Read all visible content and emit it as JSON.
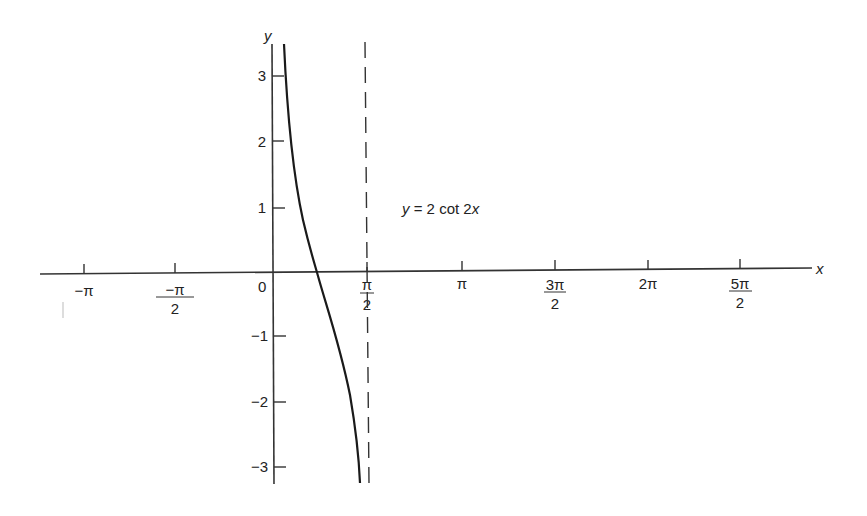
{
  "chart_data": {
    "type": "line",
    "title": "",
    "annotation": "y = 2 cot 2x",
    "xlabel": "x",
    "ylabel": "y",
    "origin_label": "0",
    "x_ticks": [
      {
        "value": -3.14159,
        "label": "−π",
        "num": "−π",
        "den": ""
      },
      {
        "value": -1.5708,
        "label": "−π/2",
        "num": "−π",
        "den": "2"
      },
      {
        "value": 1.5708,
        "label": "π/2",
        "num": "π",
        "den": "2"
      },
      {
        "value": 3.14159,
        "label": "π",
        "num": "π",
        "den": ""
      },
      {
        "value": 4.71239,
        "label": "3π/2",
        "num": "3π",
        "den": "2"
      },
      {
        "value": 6.28319,
        "label": "2π",
        "num": "2π",
        "den": ""
      },
      {
        "value": 7.85398,
        "label": "5π/2",
        "num": "5π",
        "den": "2"
      }
    ],
    "y_ticks": [
      {
        "value": 3,
        "label": "3"
      },
      {
        "value": 2,
        "label": "2"
      },
      {
        "value": 1,
        "label": "1"
      },
      {
        "value": -1,
        "label": "−1"
      },
      {
        "value": -2,
        "label": "−2"
      },
      {
        "value": -3,
        "label": "−3"
      }
    ],
    "xlim": [
      -3.6,
      8.5
    ],
    "ylim": [
      -3.3,
      3.5
    ],
    "grid": false,
    "legend": null,
    "series": [
      {
        "name": "y = 2 cot 2x",
        "style": "solid",
        "x": [
          0.29,
          0.35,
          0.4,
          0.5,
          0.6,
          0.7,
          0.785,
          0.9,
          1.0,
          1.1,
          1.2,
          1.3,
          1.4,
          1.45
        ],
        "y": [
          3.35,
          2.65,
          2.16,
          1.28,
          0.77,
          0.42,
          0.0,
          -0.51,
          -0.92,
          -1.43,
          -2.12,
          -3.12,
          -4.43,
          -5.3
        ]
      }
    ],
    "asymptotes": [
      {
        "x": 1.5708,
        "label": "π/2",
        "style": "dashed"
      }
    ]
  }
}
